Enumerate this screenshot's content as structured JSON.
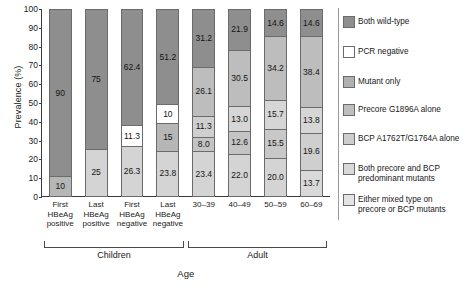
{
  "chart_data": {
    "type": "bar",
    "subtype": "stacked-100-percent",
    "title": "",
    "xlabel": "Age",
    "ylabel": "Prevalence (%)",
    "ylim": [
      0,
      100
    ],
    "yticks": [
      0,
      10,
      20,
      30,
      40,
      50,
      60,
      70,
      80,
      90,
      100
    ],
    "grid": false,
    "legend_position": "right",
    "categories": [
      "First HBeAg positive",
      "Last HBeAg positive",
      "First HBeAg negative",
      "Last HBeAg negative",
      "30–39",
      "40–49",
      "50–59",
      "60–69"
    ],
    "category_lines": [
      [
        "First",
        "HBeAg",
        "positive"
      ],
      [
        "Last",
        "HBeAg",
        "positive"
      ],
      [
        "First",
        "HBeAg",
        "negative"
      ],
      [
        "Last",
        "HBeAg",
        "negative"
      ],
      [
        "30–39"
      ],
      [
        "40–49"
      ],
      [
        "50–59"
      ],
      [
        "60–69"
      ]
    ],
    "series": [
      {
        "name": "Both wild-type",
        "color": "#8e8e8e",
        "values": [
          90,
          75,
          62.4,
          51.2,
          31.2,
          21.9,
          14.6,
          14.6
        ]
      },
      {
        "name": "PCR negative",
        "color": "#ffffff",
        "values": [
          0,
          0,
          11.3,
          10,
          0,
          0,
          0,
          0
        ]
      },
      {
        "name": "Mutant only",
        "color": "#b0b0b0",
        "values": [
          0,
          0,
          0,
          15,
          26.1,
          30.5,
          34.2,
          38.4
        ]
      },
      {
        "name": "Precore G1896A alone",
        "color": "#bebebe",
        "values": [
          0,
          0,
          0,
          0,
          11.3,
          13.0,
          15.7,
          13.8
        ]
      },
      {
        "name": "BCP A1762T/G1764A alone",
        "color": "#cdcdcd",
        "values": [
          0,
          0,
          0,
          0,
          8.0,
          12.6,
          15.5,
          19.6
        ]
      },
      {
        "name": "Both precore and BCP predominant mutants",
        "color": "#d9d9d9",
        "values": [
          10,
          25,
          26.3,
          23.8,
          23.4,
          22.0,
          20.0,
          13.7
        ]
      },
      {
        "name": "Either mixed type on precore or BCP mutants",
        "color": "#e4e4e4",
        "values": [
          0,
          0,
          0,
          0,
          0,
          0,
          0,
          0
        ]
      }
    ],
    "bars": [
      {
        "category": "First HBeAg positive",
        "segments": [
          {
            "series": "Both wild-type",
            "value": 90,
            "label": "90",
            "color": "#8e8e8e"
          },
          {
            "series": "Both precore and BCP predominant mutants",
            "value": 10,
            "label": "10",
            "color": "#b6b6b6"
          }
        ]
      },
      {
        "category": "Last HBeAg positive",
        "segments": [
          {
            "series": "Both wild-type",
            "value": 75,
            "label": "75",
            "color": "#8e8e8e"
          },
          {
            "series": "Both precore and BCP predominant mutants",
            "value": 25,
            "label": "25",
            "color": "#d4d4d4"
          }
        ]
      },
      {
        "category": "First HBeAg negative",
        "segments": [
          {
            "series": "Both wild-type",
            "value": 62.4,
            "label": "62.4",
            "color": "#8e8e8e"
          },
          {
            "series": "PCR negative",
            "value": 11.3,
            "label": "11.3",
            "color": "#ffffff"
          },
          {
            "series": "Both precore and BCP predominant mutants",
            "value": 26.3,
            "label": "26.3",
            "color": "#d4d4d4"
          }
        ]
      },
      {
        "category": "Last HBeAg negative",
        "segments": [
          {
            "series": "Both wild-type",
            "value": 51.2,
            "label": "51.2",
            "color": "#8e8e8e"
          },
          {
            "series": "PCR negative",
            "value": 10,
            "label": "10",
            "color": "#ffffff"
          },
          {
            "series": "Mutant only",
            "value": 15,
            "label": "15",
            "color": "#b6b6b6"
          },
          {
            "series": "Both precore and BCP predominant mutants",
            "value": 23.8,
            "label": "23.8",
            "color": "#d4d4d4"
          }
        ]
      },
      {
        "category": "30–39",
        "segments": [
          {
            "series": "Both wild-type",
            "value": 31.2,
            "label": "31.2",
            "color": "#8e8e8e"
          },
          {
            "series": "Mutant only",
            "value": 26.1,
            "label": "26.1",
            "color": "#bdbdbd"
          },
          {
            "series": "Precore G1896A alone",
            "value": 11.3,
            "label": "11.3",
            "color": "#cfcfcf"
          },
          {
            "series": "BCP A1762T/G1764A alone",
            "value": 8.0,
            "label": "8.0",
            "color": "#c4c4c4"
          },
          {
            "series": "Both precore and BCP predominant mutants",
            "value": 23.4,
            "label": "23.4",
            "color": "#d4d4d4"
          }
        ]
      },
      {
        "category": "40–49",
        "segments": [
          {
            "series": "Both wild-type",
            "value": 21.9,
            "label": "21.9",
            "color": "#8e8e8e"
          },
          {
            "series": "Mutant only",
            "value": 30.5,
            "label": "30.5",
            "color": "#bdbdbd"
          },
          {
            "series": "Precore G1896A alone",
            "value": 13.0,
            "label": "13.0",
            "color": "#d6d6d6"
          },
          {
            "series": "BCP A1762T/G1764A alone",
            "value": 12.6,
            "label": "12.6",
            "color": "#c4c4c4"
          },
          {
            "series": "Both precore and BCP predominant mutants",
            "value": 22.0,
            "label": "22.0",
            "color": "#d4d4d4"
          }
        ]
      },
      {
        "category": "50–59",
        "segments": [
          {
            "series": "Both wild-type",
            "value": 14.6,
            "label": "14.6",
            "color": "#8e8e8e"
          },
          {
            "series": "Mutant only",
            "value": 34.2,
            "label": "34.2",
            "color": "#bdbdbd"
          },
          {
            "series": "Precore G1896A alone",
            "value": 15.7,
            "label": "15.7",
            "color": "#d6d6d6"
          },
          {
            "series": "BCP A1762T/G1764A alone",
            "value": 15.5,
            "label": "15.5",
            "color": "#c8c8c8"
          },
          {
            "series": "Both precore and BCP predominant mutants",
            "value": 20.0,
            "label": "20.0",
            "color": "#d4d4d4"
          }
        ]
      },
      {
        "category": "60–69",
        "segments": [
          {
            "series": "Both wild-type",
            "value": 14.6,
            "label": "14.6",
            "color": "#8e8e8e"
          },
          {
            "series": "Mutant only",
            "value": 38.4,
            "label": "38.4",
            "color": "#bdbdbd"
          },
          {
            "series": "Precore G1896A alone",
            "value": 13.8,
            "label": "13.8",
            "color": "#d6d6d6"
          },
          {
            "series": "BCP A1762T/G1764A alone",
            "value": 19.6,
            "label": "19.6",
            "color": "#cfcfcf"
          },
          {
            "series": "Both precore and BCP predominant mutants",
            "value": 13.7,
            "label": "13.7",
            "color": "#d9d9d9"
          }
        ]
      }
    ],
    "groups": [
      {
        "label": "Children",
        "start": 0,
        "end": 3
      },
      {
        "label": "Adult",
        "start": 4,
        "end": 7
      }
    ],
    "legend": [
      {
        "label": "Both wild-type",
        "color": "#8e8e8e"
      },
      {
        "label": "PCR negative",
        "color": "#ffffff"
      },
      {
        "label": "Mutant only",
        "color": "#b0b0b0"
      },
      {
        "label": "Precore G1896A alone",
        "color": "#bebebe"
      },
      {
        "label": "BCP A1762T/G1764A alone",
        "color": "#cdcdcd"
      },
      {
        "label": "Both precore and BCP\npredominant mutants",
        "color": "#d9d9d9"
      },
      {
        "label": "Either mixed type on\nprecore or BCP mutants",
        "color": "#e4e4e4"
      }
    ]
  }
}
